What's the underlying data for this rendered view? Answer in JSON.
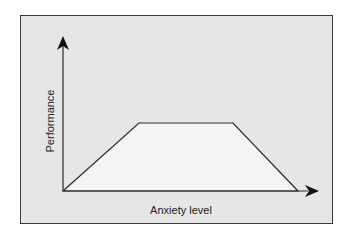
{
  "diagram": {
    "type": "performance-anxiety curve",
    "xlabel": "Anxiety level",
    "ylabel": "Performance",
    "shape": "trapezoid",
    "points_px": [
      [
        63,
        191
      ],
      [
        139,
        123
      ],
      [
        233,
        123
      ],
      [
        298,
        191
      ]
    ],
    "colors": {
      "panel_background": "#e6e6e6",
      "curve_fill": "#f4f4f4",
      "line": "#2a2a2a",
      "border": "#3a3a3a"
    }
  }
}
